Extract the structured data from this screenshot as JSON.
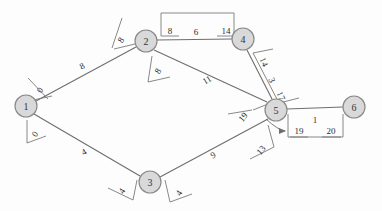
{
  "diagram": {
    "canvas": {
      "width": 382,
      "height": 211
    },
    "colors": {
      "node_fill": "#d9d9d9",
      "node_stroke": "#8a8a8a",
      "edge_stroke": "#6e6e6e",
      "text": "#2e2e2e",
      "background": "#fdfdfd"
    }
  },
  "nodes": [
    {
      "id": "1",
      "label": "1",
      "x": 26,
      "y": 106,
      "r": 11
    },
    {
      "id": "2",
      "label": "2",
      "x": 146,
      "y": 41,
      "r": 11
    },
    {
      "id": "3",
      "label": "3",
      "x": 150,
      "y": 182,
      "r": 11
    },
    {
      "id": "4",
      "label": "4",
      "x": 243,
      "y": 39,
      "r": 11
    },
    {
      "id": "5",
      "label": "5",
      "x": 276,
      "y": 110,
      "r": 11
    },
    {
      "id": "6",
      "label": "6",
      "x": 354,
      "y": 107,
      "r": 11
    }
  ],
  "edges": [
    {
      "id": "e12",
      "from": "1",
      "to": "2",
      "weight": "8",
      "wx": 82,
      "wy": 66
    },
    {
      "id": "e13",
      "from": "1",
      "to": "3",
      "weight": "4",
      "wx": 84,
      "wy": 152
    },
    {
      "id": "e24",
      "from": "2",
      "to": "4",
      "weight": "6",
      "wx": 196,
      "wy": 33
    },
    {
      "id": "e25",
      "from": "2",
      "to": "5",
      "weight": "11",
      "wx": 207,
      "wy": 80
    },
    {
      "id": "e35",
      "from": "3",
      "to": "5",
      "weight": "9",
      "wx": 213,
      "wy": 155
    },
    {
      "id": "e45",
      "from": "4",
      "to": "5",
      "weight": "",
      "wx": 0,
      "wy": 0
    },
    {
      "id": "e56",
      "from": "5",
      "to": "6",
      "weight": "1",
      "wx": 315,
      "wy": 119
    }
  ],
  "node_tags": [
    {
      "id": "t1a",
      "node": "1",
      "value": "0",
      "x": 40,
      "y": 90,
      "rotate": -58
    },
    {
      "id": "t1b",
      "node": "1",
      "value": "0",
      "x": 35,
      "y": 134,
      "rotate": -58
    },
    {
      "id": "t2a",
      "node": "2",
      "value": "8",
      "x": 122,
      "y": 40,
      "rotate": -58
    },
    {
      "id": "t2b",
      "node": "2",
      "value": "8",
      "x": 160,
      "y": 71,
      "rotate": -58
    },
    {
      "id": "t3a",
      "node": "3",
      "value": "4",
      "x": 120,
      "y": 192,
      "rotate": -58
    },
    {
      "id": "t3b",
      "node": "3",
      "value": "4",
      "x": 178,
      "y": 193,
      "rotate": -58
    },
    {
      "id": "t5a",
      "node": "5",
      "value": "19",
      "x": 243,
      "y": 118,
      "rotate": -58
    },
    {
      "id": "t5b",
      "node": "5",
      "value": "13",
      "x": 261,
      "y": 150,
      "rotate": -58
    }
  ],
  "edge_brackets": [
    {
      "id": "b24",
      "edge": "e24",
      "values": [
        {
          "text": "8",
          "x": 170,
          "y": 30
        },
        {
          "text": "14",
          "x": 226,
          "y": 30
        }
      ]
    },
    {
      "id": "b45",
      "edge": "e45",
      "values": [
        {
          "text": "14",
          "x": 264,
          "y": 62,
          "rotate": 66
        },
        {
          "text": "3",
          "x": 272,
          "y": 80,
          "rotate": 66
        },
        {
          "text": "17",
          "x": 281,
          "y": 96,
          "rotate": 66
        }
      ]
    },
    {
      "id": "b56",
      "edge": "e56",
      "values": [
        {
          "text": "19",
          "x": 299,
          "y": 131
        },
        {
          "text": "20",
          "x": 331,
          "y": 131
        }
      ]
    }
  ],
  "annotations": [
    {
      "id": "arrow-to-19",
      "type": "arrow",
      "label": "arrow-pointing-to-19",
      "from_x": 268,
      "from_y": 121,
      "to_x": 289,
      "to_y": 131
    }
  ]
}
